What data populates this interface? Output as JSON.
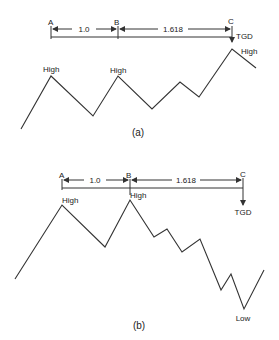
{
  "panels": [
    {
      "id": "a",
      "caption": "(a)",
      "points": {
        "A": "A",
        "B": "B",
        "C": "C"
      },
      "ratios": {
        "ab": "1.0",
        "bc": "1.618"
      },
      "target_label": "TGD",
      "extreme_labels": [
        "High",
        "High",
        "High"
      ]
    },
    {
      "id": "b",
      "caption": "(b)",
      "points": {
        "A": "A",
        "B": "B",
        "C": "C"
      },
      "ratios": {
        "ab": "1.0",
        "bc": "1.618"
      },
      "target_label": "TGD",
      "extreme_labels": [
        "High",
        "High",
        "Low"
      ]
    }
  ],
  "colors": {
    "line": "#333333",
    "text": "#222222",
    "background": "#ffffff"
  }
}
